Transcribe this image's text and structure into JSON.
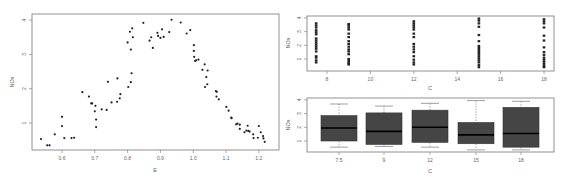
{
  "chart_data": [
    {
      "id": "scatter-e",
      "type": "scatter",
      "title": "",
      "xlabel": "E",
      "ylabel": "NOx",
      "xlim": [
        0.52,
        1.24
      ],
      "ylim": [
        0.3,
        4.1
      ],
      "xticks": [
        0.6,
        0.7,
        0.8,
        0.9,
        1.0,
        1.1,
        1.2
      ],
      "xtick_labels": [
        "0.6",
        "0.7",
        "0.8",
        "0.9",
        "1.0",
        "1.1",
        "1.2"
      ],
      "yticks": [
        1,
        2,
        3,
        4
      ],
      "ytick_labels": [
        "1",
        "2",
        "3",
        "4"
      ],
      "grid": false,
      "x": [
        0.536,
        0.555,
        0.562,
        0.578,
        0.6,
        0.6,
        0.607,
        0.629,
        0.637,
        0.662,
        0.682,
        0.689,
        0.692,
        0.702,
        0.7,
        0.704,
        0.704,
        0.721,
        0.736,
        0.74,
        0.751,
        0.769,
        0.768,
        0.776,
        0.778,
        0.802,
        0.8,
        0.807,
        0.81,
        0.81,
        0.812,
        0.814,
        0.816,
        0.848,
        0.867,
        0.872,
        0.877,
        0.891,
        0.893,
        0.9,
        0.905,
        0.91,
        0.927,
        0.934,
        0.962,
        0.98,
        0.991,
        1.002,
        1.002,
        1.003,
        1.006,
        1.009,
        1.016,
        1.028,
        1.035,
        1.036,
        1.04,
        1.044,
        1.043,
        1.069,
        1.071,
        1.072,
        1.078,
        1.101,
        1.108,
        1.116,
        1.117,
        1.131,
        1.135,
        1.142,
        1.142,
        1.156,
        1.162,
        1.166,
        1.168,
        1.172,
        1.183,
        1.184,
        1.197,
        1.2,
        1.206,
        1.213,
        1.214,
        1.218
      ],
      "y": [
        0.53,
        0.35,
        0.35,
        0.67,
        1.18,
        0.91,
        0.56,
        0.56,
        0.57,
        1.9,
        1.77,
        1.57,
        1.57,
        1.5,
        1.34,
        1.1,
        0.88,
        1.4,
        1.38,
        2.2,
        1.6,
        2.3,
        1.62,
        1.72,
        1.84,
        2.05,
        3.35,
        3.66,
        3.14,
        2.19,
        2.45,
        3.76,
        3.5,
        3.92,
        3.4,
        3.5,
        3.19,
        3.63,
        3.54,
        3.48,
        3.73,
        3.51,
        3.65,
        4.01,
        3.93,
        3.61,
        3.71,
        3.27,
        3.1,
        2.93,
        2.81,
        2.83,
        2.85,
        2.55,
        2.71,
        2.05,
        2.34,
        2.53,
        2.13,
        1.93,
        1.77,
        1.91,
        1.69,
        1.47,
        1.36,
        1.16,
        1.14,
        0.96,
        0.98,
        0.95,
        0.83,
        0.73,
        0.78,
        0.92,
        0.77,
        0.75,
        0.67,
        0.56,
        0.57,
        0.91,
        0.73,
        0.62,
        0.55,
        0.45
      ]
    },
    {
      "id": "strip-c",
      "type": "scatter",
      "title": "",
      "xlabel": "C",
      "ylabel": "NOx",
      "xlim": [
        7.0,
        18.4
      ],
      "ylim": [
        0.3,
        4.1
      ],
      "xticks": [
        8,
        10,
        12,
        14,
        16,
        18
      ],
      "xtick_labels": [
        "8",
        "10",
        "12",
        "14",
        "16",
        "18"
      ],
      "yticks": [
        1,
        2,
        3,
        4
      ],
      "ytick_labels": [
        "1",
        "2",
        "3",
        "4"
      ],
      "grid": false,
      "groups": [
        {
          "c": 7.5,
          "values": [
            3.6,
            3.45,
            3.3,
            3.1,
            2.95,
            2.8,
            2.5,
            2.35,
            2.2,
            2.05,
            1.9,
            1.75,
            1.55,
            1.2,
            1.1,
            0.9,
            0.75
          ]
        },
        {
          "c": 9,
          "values": [
            3.55,
            3.45,
            3.3,
            3.15,
            2.85,
            2.6,
            2.3,
            2.1,
            1.9,
            1.7,
            1.55,
            1.35,
            1.0,
            0.85,
            0.7,
            0.6
          ]
        },
        {
          "c": 12,
          "values": [
            3.75,
            3.6,
            3.45,
            3.3,
            3.15,
            2.85,
            2.6,
            2.1,
            1.9,
            1.7,
            1.5,
            1.2,
            0.95,
            0.75,
            0.6
          ]
        },
        {
          "c": 15,
          "values": [
            3.95,
            3.8,
            3.6,
            3.35,
            2.75,
            2.3,
            1.95,
            1.8,
            1.65,
            1.5,
            1.35,
            1.2,
            1.05,
            0.9,
            0.75,
            0.55,
            0.4
          ]
        },
        {
          "c": 18,
          "values": [
            3.9,
            3.75,
            3.6,
            3.3,
            2.7,
            2.35,
            1.85,
            1.5,
            1.3,
            1.1,
            0.95,
            0.8,
            0.65,
            0.5,
            0.4
          ]
        }
      ]
    },
    {
      "id": "box-c",
      "type": "box",
      "title": "",
      "xlabel": "C",
      "ylabel": "NOx",
      "ylim": [
        0.3,
        4.1
      ],
      "yticks": [
        1,
        2,
        3,
        4
      ],
      "ytick_labels": [
        "1",
        "2",
        "3",
        "4"
      ],
      "categories": [
        "7.5",
        "9",
        "12",
        "15",
        "18"
      ],
      "boxes": [
        {
          "label": "7.5",
          "whisker_low": 0.55,
          "q1": 1.0,
          "median": 1.95,
          "q3": 2.85,
          "whisker_high": 3.7
        },
        {
          "label": "9",
          "whisker_low": 0.6,
          "q1": 0.75,
          "median": 1.7,
          "q3": 3.05,
          "whisker_high": 3.55
        },
        {
          "label": "12",
          "whisker_low": 0.55,
          "q1": 0.9,
          "median": 2.0,
          "q3": 3.25,
          "whisker_high": 3.75
        },
        {
          "label": "15",
          "whisker_low": 0.35,
          "q1": 0.8,
          "median": 1.45,
          "q3": 2.35,
          "whisker_high": 3.95
        },
        {
          "label": "18",
          "whisker_low": 0.35,
          "q1": 0.55,
          "median": 1.55,
          "q3": 3.45,
          "whisker_high": 3.9
        }
      ],
      "box_color": "#454545"
    }
  ]
}
